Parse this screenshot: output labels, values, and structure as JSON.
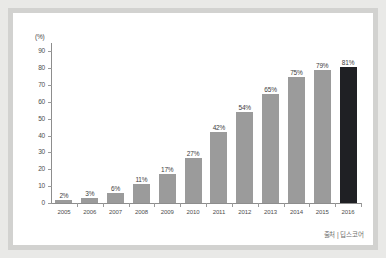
{
  "source_note": "출처 | 딥스코어",
  "chart_data": {
    "type": "bar",
    "title": "",
    "xlabel": "",
    "ylabel": "(%)",
    "unit_label": "(%)",
    "ylim": [
      0,
      95
    ],
    "yticks": [
      0,
      10,
      20,
      30,
      40,
      50,
      60,
      70,
      80,
      90
    ],
    "ytick_labels": [
      "0",
      "10",
      "20",
      "30",
      "40",
      "50",
      "60",
      "70",
      "80",
      "90"
    ],
    "grid": false,
    "legend": null,
    "categories": [
      "2005",
      "2006",
      "2007",
      "2008",
      "2009",
      "2010",
      "2011",
      "2012",
      "2013",
      "2014",
      "2015",
      "2016"
    ],
    "values": [
      2,
      3,
      6,
      11,
      17,
      27,
      42,
      54,
      65,
      75,
      79,
      81
    ],
    "data_labels": [
      "2%",
      "3%",
      "6%",
      "11%",
      "17%",
      "27%",
      "42%",
      "54%",
      "65%",
      "75%",
      "79%",
      "81%"
    ],
    "bar_colors": [
      "#9b9b9b",
      "#9b9b9b",
      "#9b9b9b",
      "#9b9b9b",
      "#9b9b9b",
      "#9b9b9b",
      "#9b9b9b",
      "#9b9b9b",
      "#9b9b9b",
      "#9b9b9b",
      "#9b9b9b",
      "#1f2024"
    ],
    "highlight_index": 11,
    "colors": {
      "bar": "#9b9b9b",
      "bar_highlight": "#1f2024",
      "axis": "#8d8d8d",
      "text": "#4d4d4d",
      "card": "#ffffff",
      "frame": "#d2d2d0",
      "page": "#e9e9e7"
    }
  }
}
